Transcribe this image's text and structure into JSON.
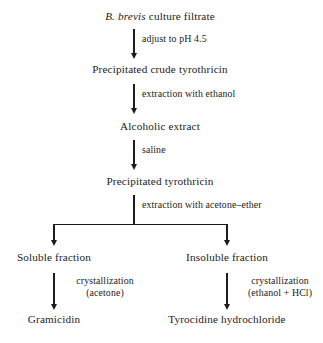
{
  "diagram": {
    "nodes": {
      "n1_prefix": "B. brevis",
      "n1_rest": " culture filtrate",
      "n2": "Precipitated crude tyrothricin",
      "n3": "Alcoholic extract",
      "n4": "Precipitated tyrothricin",
      "n5_left": "Soluble fraction",
      "n5_right": "Insoluble fraction",
      "n6_left": "Gramicidin",
      "n6_right": "Tyrocidine hydrochloride"
    },
    "edges": {
      "e1": "adjust to pH 4.5",
      "e2": "extraction with ethanol",
      "e3": "saline",
      "e4": "extraction with acetone–ether",
      "e5_left_line1": "crystallization",
      "e5_left_line2": "(acetone)",
      "e5_right_line1": "crystallization",
      "e5_right_line2": "(ethanol + HCl)"
    },
    "colors": {
      "ink": "#1c1c1c",
      "background": "#ffffff"
    }
  }
}
